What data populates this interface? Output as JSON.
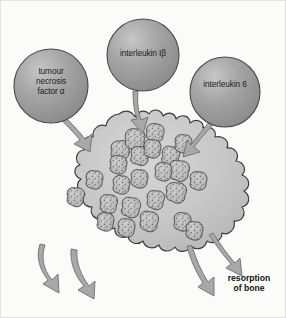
{
  "figure": {
    "background_color": "#fbfbfa",
    "border_color": "#e2e2e0"
  },
  "colors": {
    "circle_fill": "#9a9a9a",
    "circle_highlight": "#c4c4c4",
    "circle_stroke": "#4a4a4a",
    "cell_fill": "#c6c6c6",
    "cell_highlight": "#d8d8d8",
    "cell_stroke": "#3a3a3a",
    "nucleus_fill": "#bdbdbd",
    "nucleus_stroke": "#3c3c3c",
    "nucleus_speckle": "#6a6a6a",
    "arrow_fill": "#a8a8a8",
    "arrow_stroke": "#6f6f6f",
    "text_color": "#1b1b1b"
  },
  "cytokines": [
    {
      "id": "tnf-alpha",
      "label": "tumour\nnecrosis\nfactor α",
      "cx": 50,
      "cy": 85,
      "r": 37
    },
    {
      "id": "interleukin-1-beta",
      "label": "interleukin Iβ",
      "cx": 142,
      "cy": 54,
      "r": 36
    },
    {
      "id": "interleukin-6",
      "label": "interleukin 6",
      "cx": 224,
      "cy": 91,
      "r": 35
    }
  ],
  "cell": {
    "id": "osteoclast",
    "type": "multinucleated osteoclast",
    "nuclei_count": 24
  },
  "outputs": {
    "arrow_count": 4,
    "resorption_label": "resorption\nof bone"
  }
}
